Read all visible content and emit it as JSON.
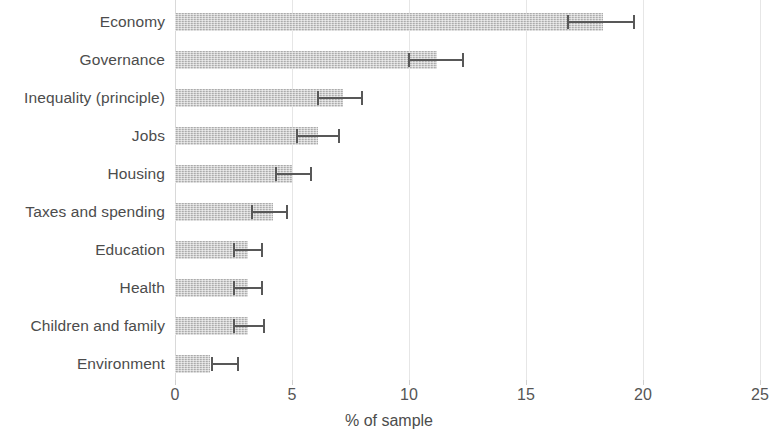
{
  "chart_data": {
    "type": "bar",
    "orientation": "horizontal",
    "title": "",
    "subtitle": "",
    "xlabel": "% of sample",
    "ylabel": "",
    "xlim": [
      0,
      25
    ],
    "xticks": [
      0,
      5,
      10,
      15,
      20,
      25
    ],
    "xtick_labels": [
      "0",
      "5",
      "10",
      "15",
      "20",
      "25"
    ],
    "grid": true,
    "grid_axis": "x",
    "legend": null,
    "error_bars": "asymmetric confidence intervals",
    "bar_color": "#b9b9b9",
    "error_color": "#585858",
    "grid_color": "#e6e6e6",
    "text_color": "#4c4c4c",
    "categories": [
      "Economy",
      "Governance",
      "Inequality (principle)",
      "Jobs",
      "Housing",
      "Taxes and spending",
      "Education",
      "Health",
      "Children and family",
      "Environment"
    ],
    "values": [
      18.3,
      11.2,
      7.2,
      6.1,
      5.0,
      4.2,
      3.1,
      3.1,
      3.1,
      1.5
    ],
    "ci_low": [
      16.8,
      10.0,
      6.1,
      5.2,
      4.3,
      3.3,
      2.5,
      2.5,
      2.5,
      1.6
    ],
    "ci_high": [
      19.6,
      12.3,
      8.0,
      7.0,
      5.8,
      4.8,
      3.7,
      3.7,
      3.8,
      2.7
    ]
  }
}
